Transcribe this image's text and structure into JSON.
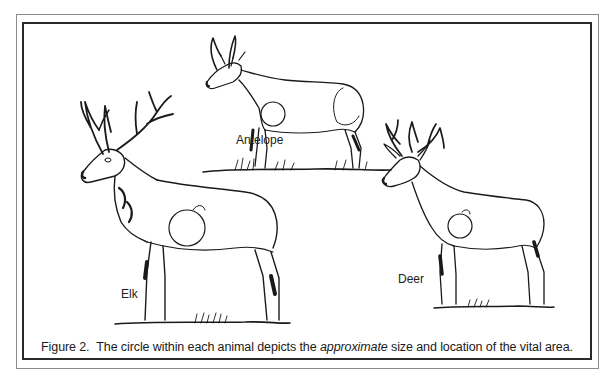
{
  "figure": {
    "number": "Figure 2.",
    "caption_before": "The circle within each animal depicts the ",
    "caption_emphasis": "approximate",
    "caption_after": " size and location of the vital area."
  },
  "animals": [
    {
      "label": "Antelope",
      "position": "top-center"
    },
    {
      "label": "Elk",
      "position": "left"
    },
    {
      "label": "Deer",
      "position": "right"
    }
  ],
  "colors": {
    "line": "#1a1a1a",
    "outer_frame": "#8a8a8a",
    "inner_frame": "#2a2a2a",
    "background": "#ffffff"
  }
}
